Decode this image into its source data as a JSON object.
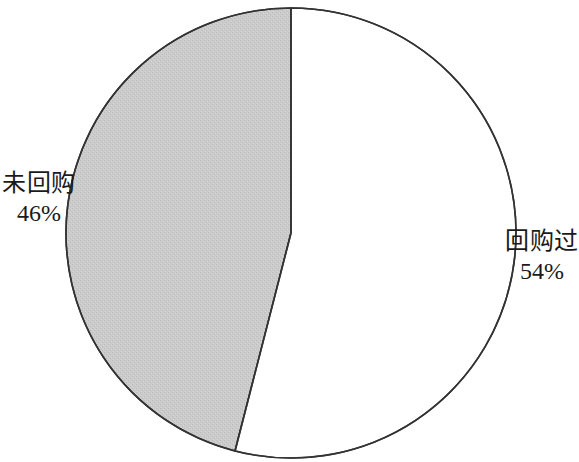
{
  "chart_data": {
    "type": "pie",
    "title": "",
    "subtitle": "",
    "xlabel": "",
    "ylabel": "",
    "legend_position": "none",
    "grid": false,
    "labels_inline": true,
    "categories": [
      "回购过",
      "未回购"
    ],
    "values": [
      54,
      46
    ],
    "value_unit": "%",
    "slices": [
      {
        "name": "回购过",
        "value": 54,
        "value_label": "54%",
        "color": "#ffffff",
        "stroke": "#333333",
        "start_angle_deg": 0,
        "end_angle_deg": 194.4,
        "label_position": "right"
      },
      {
        "name": "未回购",
        "value": 46,
        "value_label": "46%",
        "color": "#c9c9c9",
        "stroke": "#333333",
        "start_angle_deg": 194.4,
        "end_angle_deg": 360,
        "label_position": "left"
      }
    ]
  },
  "labels": {
    "left": {
      "name": "未回购",
      "value": "46%"
    },
    "right": {
      "name": "回购过",
      "value": "54%"
    }
  },
  "style": {
    "background": "#ffffff",
    "slice_gray": "#c9c9c9",
    "slice_white": "#ffffff",
    "outline": "#333333",
    "text": "#1a1a1a"
  }
}
